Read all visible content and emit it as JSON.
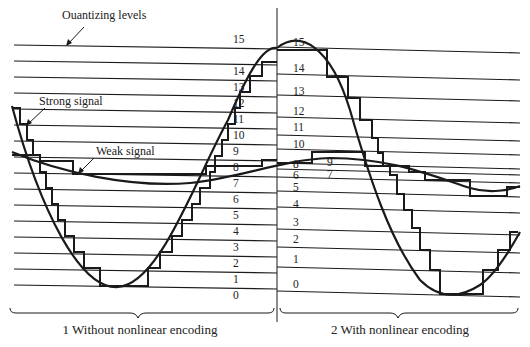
{
  "diagram": {
    "labels": {
      "quantizing_levels": "Ouantizing levels",
      "strong_signal": "Strong signal",
      "weak_signal": "Weak signal"
    },
    "captions": {
      "left": "1 Without nonlinear encoding",
      "right": "2 With nonlinear encoding"
    },
    "left_levels": [
      "0",
      "1",
      "2",
      "3",
      "4",
      "5",
      "6",
      "7",
      "8",
      "9",
      "10",
      "11",
      "12",
      "13",
      "14",
      "15"
    ],
    "right_levels": [
      "0",
      "1",
      "2",
      "3",
      "4",
      "5",
      "6",
      "7",
      "8",
      "9",
      "10",
      "11",
      "12",
      "13",
      "14",
      "15"
    ],
    "colors": {
      "line": "#1a1a1a",
      "background": "#ffffff"
    }
  }
}
